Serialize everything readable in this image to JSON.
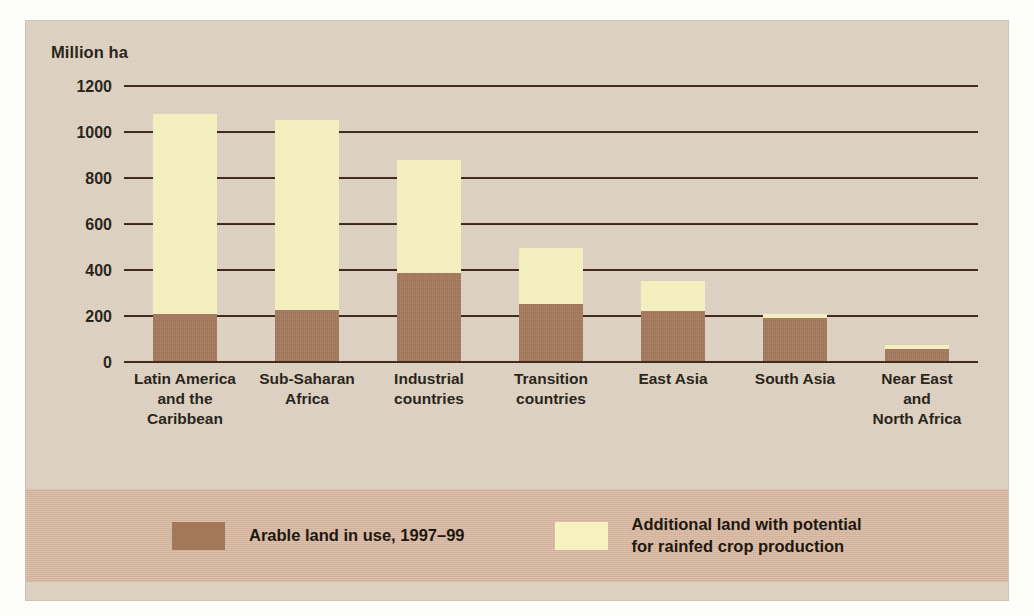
{
  "chart_data": {
    "type": "bar",
    "subtype": "stacked-bar",
    "title": "",
    "xlabel": "",
    "ylabel": "Million ha",
    "ylim": [
      0,
      1200
    ],
    "yticks": [
      0,
      200,
      400,
      600,
      800,
      1000,
      1200
    ],
    "ytick_labels": [
      "0",
      "200",
      "400",
      "600",
      "800",
      "1000",
      "1200"
    ],
    "grid": true,
    "legend_position": "bottom",
    "categories": [
      "Latin America\nand the\nCaribbean",
      "Sub-Saharan\nAfrica",
      "Industrial\ncountries",
      "Transition\ncountries",
      "East Asia",
      "South Asia",
      "Near East\nand\nNorth Africa"
    ],
    "series": [
      {
        "name": "Arable land in use, 1997–99",
        "color": "#a3775a",
        "values": [
          203,
          222,
          384,
          249,
          217,
          185,
          52
        ]
      },
      {
        "name": "Additional land with potential\nfor rainfed crop production",
        "color": "#f7f2bf",
        "values": [
          872,
          826,
          492,
          243,
          131,
          19,
          18
        ]
      }
    ],
    "totals": [
      1075,
      1048,
      876,
      492,
      348,
      204,
      70
    ]
  },
  "legend": {
    "items": [
      {
        "label": "Arable land in use, 1997–99",
        "color": "#a3775a"
      },
      {
        "label": "Additional land with potential\nfor rainfed crop production",
        "color": "#f7f2bf"
      }
    ]
  },
  "axis": {
    "y_axis_title": "Million ha"
  },
  "colors": {
    "figure_background": "#ded2c2",
    "legend_background": "#d9b9a2",
    "gridline": "#3a2315",
    "arable": "#a3775a",
    "potential": "#f7f2bf",
    "text": "#231a12"
  }
}
